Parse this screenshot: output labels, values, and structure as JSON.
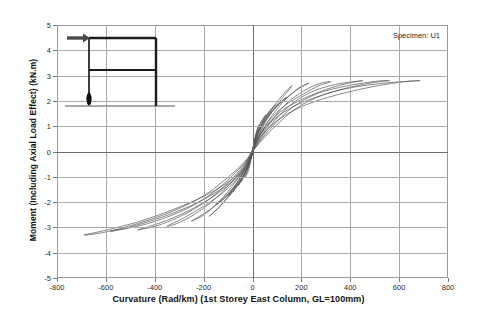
{
  "chart_data": {
    "type": "line",
    "title": "",
    "xlabel": "Curvature (Rad/km)  (1st Storey East Column, GL=100mm)",
    "ylabel": "Moment (Including Axial Load Effect)  (kN.m)",
    "xlim": [
      -800,
      800
    ],
    "ylim": [
      -5,
      5
    ],
    "xticks": [
      -800,
      -600,
      -400,
      -200,
      0,
      200,
      400,
      600,
      800
    ],
    "yticks": [
      -5,
      -4,
      -3,
      -2,
      -1,
      0,
      1,
      2,
      3,
      4,
      5
    ],
    "grid": true,
    "legend": false,
    "annotations": [
      {
        "name": "specimen-label",
        "text": "Specimen: U1"
      }
    ],
    "series": [
      {
        "name": "cycle-1",
        "peak_curvature": 28,
        "peak_moment": 1.05,
        "min_curvature": -30,
        "min_moment": -1.0,
        "points": [
          [
            0,
            0
          ],
          [
            10,
            0.55
          ],
          [
            20,
            0.9
          ],
          [
            28,
            1.05
          ],
          [
            18,
            0.78
          ],
          [
            6,
            0.35
          ],
          [
            0,
            0.05
          ],
          [
            -8,
            -0.4
          ],
          [
            -18,
            -0.8
          ],
          [
            -30,
            -1.0
          ],
          [
            -20,
            -0.72
          ],
          [
            -8,
            -0.3
          ],
          [
            0,
            0
          ]
        ]
      },
      {
        "name": "cycle-2",
        "peak_curvature": 55,
        "peak_moment": 1.45,
        "min_curvature": -60,
        "min_moment": -1.35,
        "points": [
          [
            0,
            0
          ],
          [
            14,
            0.6
          ],
          [
            32,
            1.1
          ],
          [
            55,
            1.45
          ],
          [
            40,
            1.25
          ],
          [
            20,
            0.85
          ],
          [
            6,
            0.3
          ],
          [
            0,
            0.02
          ],
          [
            -12,
            -0.5
          ],
          [
            -34,
            -1.0
          ],
          [
            -60,
            -1.35
          ],
          [
            -42,
            -1.1
          ],
          [
            -18,
            -0.6
          ],
          [
            -4,
            -0.15
          ],
          [
            0,
            0
          ]
        ]
      },
      {
        "name": "cycle-3",
        "peak_curvature": 95,
        "peak_moment": 1.85,
        "min_curvature": -100,
        "min_moment": -1.75,
        "points": [
          [
            0,
            0
          ],
          [
            16,
            0.55
          ],
          [
            42,
            1.2
          ],
          [
            70,
            1.6
          ],
          [
            95,
            1.85
          ],
          [
            72,
            1.6
          ],
          [
            44,
            1.2
          ],
          [
            18,
            0.7
          ],
          [
            4,
            0.2
          ],
          [
            0,
            0.0
          ],
          [
            -16,
            -0.5
          ],
          [
            -46,
            -1.15
          ],
          [
            -76,
            -1.55
          ],
          [
            -100,
            -1.75
          ],
          [
            -76,
            -1.5
          ],
          [
            -44,
            -1.05
          ],
          [
            -16,
            -0.5
          ],
          [
            -2,
            -0.1
          ],
          [
            0,
            0
          ]
        ]
      },
      {
        "name": "cycle-4",
        "peak_curvature": 140,
        "peak_moment": 2.15,
        "min_curvature": -150,
        "min_moment": -2.1,
        "points": [
          [
            0,
            0
          ],
          [
            18,
            0.5
          ],
          [
            52,
            1.2
          ],
          [
            92,
            1.7
          ],
          [
            140,
            2.15
          ],
          [
            110,
            1.9
          ],
          [
            70,
            1.5
          ],
          [
            34,
            1.0
          ],
          [
            10,
            0.4
          ],
          [
            0,
            0.05
          ],
          [
            -20,
            -0.45
          ],
          [
            -58,
            -1.15
          ],
          [
            -104,
            -1.7
          ],
          [
            -150,
            -2.1
          ],
          [
            -114,
            -1.85
          ],
          [
            -66,
            -1.35
          ],
          [
            -28,
            -0.8
          ],
          [
            -4,
            -0.2
          ],
          [
            0,
            0
          ]
        ]
      },
      {
        "name": "cycle-5",
        "peak_curvature": 160,
        "peak_moment": 2.6,
        "min_curvature": -175,
        "min_moment": -2.55,
        "points": [
          [
            0,
            0
          ],
          [
            20,
            0.5
          ],
          [
            58,
            1.25
          ],
          [
            105,
            1.9
          ],
          [
            150,
            2.45
          ],
          [
            160,
            2.6
          ],
          [
            130,
            2.3
          ],
          [
            88,
            1.8
          ],
          [
            46,
            1.2
          ],
          [
            14,
            0.5
          ],
          [
            0,
            0.05
          ],
          [
            -22,
            -0.5
          ],
          [
            -64,
            -1.25
          ],
          [
            -118,
            -2.0
          ],
          [
            -165,
            -2.45
          ],
          [
            -175,
            -2.55
          ],
          [
            -136,
            -2.2
          ],
          [
            -82,
            -1.6
          ],
          [
            -34,
            -0.9
          ],
          [
            -6,
            -0.25
          ],
          [
            0,
            0
          ]
        ]
      },
      {
        "name": "cycle-6",
        "peak_curvature": 230,
        "peak_moment": 2.7,
        "min_curvature": -250,
        "min_moment": -2.75,
        "points": [
          [
            0,
            0
          ],
          [
            22,
            0.45
          ],
          [
            64,
            1.2
          ],
          [
            120,
            1.9
          ],
          [
            180,
            2.45
          ],
          [
            230,
            2.7
          ],
          [
            192,
            2.5
          ],
          [
            136,
            2.1
          ],
          [
            80,
            1.6
          ],
          [
            32,
            0.9
          ],
          [
            4,
            0.2
          ],
          [
            0,
            0.0
          ],
          [
            -24,
            -0.45
          ],
          [
            -70,
            -1.2
          ],
          [
            -134,
            -1.95
          ],
          [
            -198,
            -2.5
          ],
          [
            -250,
            -2.75
          ],
          [
            -206,
            -2.5
          ],
          [
            -140,
            -2.05
          ],
          [
            -74,
            -1.4
          ],
          [
            -22,
            -0.6
          ],
          [
            0,
            -0.05
          ],
          [
            0,
            0
          ]
        ]
      },
      {
        "name": "cycle-7",
        "peak_curvature": 320,
        "peak_moment": 2.75,
        "min_curvature": -350,
        "min_moment": -2.95,
        "points": [
          [
            0,
            0
          ],
          [
            24,
            0.4
          ],
          [
            70,
            1.1
          ],
          [
            134,
            1.85
          ],
          [
            210,
            2.4
          ],
          [
            280,
            2.7
          ],
          [
            320,
            2.75
          ],
          [
            272,
            2.6
          ],
          [
            204,
            2.25
          ],
          [
            130,
            1.8
          ],
          [
            66,
            1.2
          ],
          [
            20,
            0.5
          ],
          [
            0,
            0.05
          ],
          [
            -26,
            -0.45
          ],
          [
            -80,
            -1.15
          ],
          [
            -156,
            -1.9
          ],
          [
            -240,
            -2.5
          ],
          [
            -310,
            -2.85
          ],
          [
            -350,
            -2.95
          ],
          [
            -296,
            -2.7
          ],
          [
            -214,
            -2.25
          ],
          [
            -124,
            -1.65
          ],
          [
            -50,
            -0.95
          ],
          [
            -8,
            -0.3
          ],
          [
            0,
            0
          ]
        ]
      },
      {
        "name": "cycle-8",
        "peak_curvature": 450,
        "peak_moment": 2.8,
        "min_curvature": -470,
        "min_moment": -3.1,
        "points": [
          [
            0,
            0
          ],
          [
            26,
            0.4
          ],
          [
            76,
            1.05
          ],
          [
            150,
            1.8
          ],
          [
            240,
            2.35
          ],
          [
            340,
            2.65
          ],
          [
            450,
            2.8
          ],
          [
            392,
            2.7
          ],
          [
            300,
            2.45
          ],
          [
            200,
            2.05
          ],
          [
            112,
            1.55
          ],
          [
            44,
            0.85
          ],
          [
            6,
            0.2
          ],
          [
            0,
            0.0
          ],
          [
            -28,
            -0.45
          ],
          [
            -86,
            -1.1
          ],
          [
            -172,
            -1.85
          ],
          [
            -272,
            -2.45
          ],
          [
            -380,
            -2.9
          ],
          [
            -470,
            -3.1
          ],
          [
            -402,
            -2.9
          ],
          [
            -296,
            -2.5
          ],
          [
            -180,
            -1.9
          ],
          [
            -82,
            -1.2
          ],
          [
            -18,
            -0.5
          ],
          [
            0,
            0
          ]
        ]
      },
      {
        "name": "cycle-9",
        "peak_curvature": 560,
        "peak_moment": 2.8,
        "min_curvature": -580,
        "min_moment": -3.15,
        "points": [
          [
            0,
            0
          ],
          [
            28,
            0.38
          ],
          [
            82,
            1.0
          ],
          [
            164,
            1.75
          ],
          [
            268,
            2.3
          ],
          [
            390,
            2.6
          ],
          [
            510,
            2.78
          ],
          [
            560,
            2.8
          ],
          [
            492,
            2.72
          ],
          [
            382,
            2.5
          ],
          [
            262,
            2.15
          ],
          [
            152,
            1.7
          ],
          [
            64,
            1.05
          ],
          [
            10,
            0.3
          ],
          [
            0,
            0.0
          ],
          [
            -30,
            -0.42
          ],
          [
            -92,
            -1.05
          ],
          [
            -186,
            -1.8
          ],
          [
            -300,
            -2.4
          ],
          [
            -430,
            -2.85
          ],
          [
            -545,
            -3.1
          ],
          [
            -580,
            -3.15
          ],
          [
            -500,
            -2.98
          ],
          [
            -372,
            -2.6
          ],
          [
            -232,
            -2.05
          ],
          [
            -108,
            -1.35
          ],
          [
            -26,
            -0.6
          ],
          [
            0,
            0
          ]
        ]
      },
      {
        "name": "cycle-10",
        "peak_curvature": 685,
        "peak_moment": 2.8,
        "min_curvature": -690,
        "min_moment": -3.3,
        "points": [
          [
            0,
            0
          ],
          [
            30,
            0.35
          ],
          [
            88,
            0.95
          ],
          [
            178,
            1.7
          ],
          [
            292,
            2.25
          ],
          [
            420,
            2.55
          ],
          [
            560,
            2.72
          ],
          [
            685,
            2.8
          ],
          [
            612,
            2.75
          ],
          [
            486,
            2.55
          ],
          [
            350,
            2.25
          ],
          [
            220,
            1.85
          ],
          [
            112,
            1.3
          ],
          [
            34,
            0.6
          ],
          [
            0,
            0.05
          ],
          [
            -32,
            -0.4
          ],
          [
            -98,
            -1.0
          ],
          [
            -200,
            -1.75
          ],
          [
            -324,
            -2.35
          ],
          [
            -470,
            -2.85
          ],
          [
            -610,
            -3.2
          ],
          [
            -690,
            -3.3
          ],
          [
            -604,
            -3.12
          ],
          [
            -458,
            -2.75
          ],
          [
            -300,
            -2.2
          ],
          [
            -156,
            -1.55
          ],
          [
            -48,
            -0.8
          ],
          [
            -4,
            -0.15
          ],
          [
            0,
            0
          ]
        ]
      }
    ]
  },
  "inset": {
    "name": "frame-elevation-sketch",
    "description": "two-storey portal frame with lateral load arrow and plastic hinge at first storey east column base",
    "load_arrow": "lateral-load-arrow",
    "hinge_marker": "plastic-hinge-marker",
    "ground": "ground-line"
  },
  "style": {
    "curve_color": "#555555",
    "frame_color": "#9a9a9a",
    "axis_color": "#6e6e6e",
    "text_color": "#111111",
    "inset_color": "#222222"
  }
}
